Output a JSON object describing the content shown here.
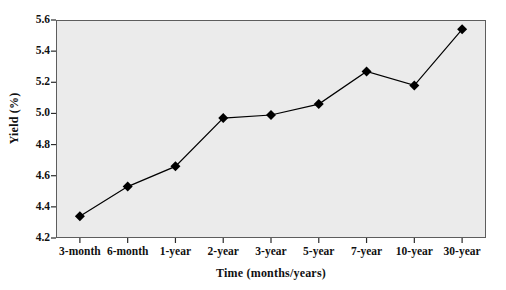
{
  "chart_data": {
    "type": "line",
    "title": "",
    "xlabel": "Time (months/years)",
    "ylabel": "Yield (%)",
    "categories": [
      "3-month",
      "6-month",
      "1-year",
      "2-year",
      "3-year",
      "5-year",
      "7-year",
      "10-year",
      "30-year"
    ],
    "values": [
      4.34,
      4.53,
      4.66,
      4.97,
      4.99,
      5.06,
      5.27,
      5.18,
      5.54
    ],
    "series": [
      {
        "name": "Yield",
        "values": [
          4.34,
          4.53,
          4.66,
          4.97,
          4.99,
          5.06,
          5.27,
          5.18,
          5.54
        ],
        "marker": "diamond",
        "marker_color": "#000000",
        "line_color": "#000000"
      }
    ],
    "ylim": [
      4.2,
      5.6
    ],
    "yticks": [
      4.2,
      4.4,
      4.6,
      4.8,
      5.0,
      5.2,
      5.4,
      5.6
    ],
    "ytick_labels": [
      "4.2",
      "4.4",
      "4.6",
      "4.8",
      "5.0",
      "5.2",
      "5.4",
      "5.6"
    ],
    "grid": false,
    "legend": null,
    "plot_background": "#ebebeb",
    "frame_color": "#5d5d5d"
  }
}
